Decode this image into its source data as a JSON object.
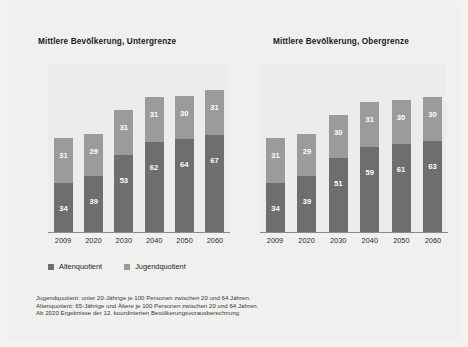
{
  "chart_data": [
    {
      "type": "bar",
      "title": "Mittlere Bevölkerung, Untergrenze",
      "xlabel": "",
      "ylabel": "",
      "stacked": true,
      "grid": false,
      "legend_position": "bottom-left",
      "categories": [
        "2009",
        "2020",
        "2030",
        "2040",
        "2050",
        "2060"
      ],
      "series": [
        {
          "name": "Altenquotient",
          "values": [
            34,
            39,
            53,
            62,
            64,
            67
          ],
          "color": "#6e6e6e"
        },
        {
          "name": "Jugendquotient",
          "values": [
            31,
            29,
            31,
            31,
            30,
            31
          ],
          "color": "#9b9b9b"
        }
      ],
      "ylim": [
        0,
        100
      ]
    },
    {
      "type": "bar",
      "title": "Mittlere Bevölkerung, Obergrenze",
      "xlabel": "",
      "ylabel": "",
      "stacked": true,
      "grid": false,
      "legend_position": "bottom-left",
      "categories": [
        "2009",
        "2020",
        "2030",
        "2040",
        "2050",
        "2060"
      ],
      "series": [
        {
          "name": "Altenquotient",
          "values": [
            34,
            39,
            51,
            59,
            61,
            63
          ],
          "color": "#6e6e6e"
        },
        {
          "name": "Jugendquotient",
          "values": [
            31,
            29,
            30,
            31,
            30,
            30
          ],
          "color": "#9b9b9b"
        }
      ],
      "ylim": [
        0,
        100
      ]
    }
  ],
  "titles": {
    "left": "Mittlere Bevölkerung, Untergrenze",
    "right": "Mittlere Bevölkerung, Obergrenze"
  },
  "legend": {
    "items": [
      {
        "label": "Altenquotient",
        "color": "#6e6e6e"
      },
      {
        "label": "Jugendquotient",
        "color": "#9b9b9b"
      }
    ]
  },
  "left": {
    "categories": [
      "2009",
      "2020",
      "2030",
      "2040",
      "2050",
      "2060"
    ],
    "old": [
      "34",
      "39",
      "53",
      "62",
      "64",
      "67"
    ],
    "young": [
      "31",
      "29",
      "31",
      "31",
      "30",
      "31"
    ]
  },
  "right": {
    "categories": [
      "2009",
      "2020",
      "2030",
      "2040",
      "2050",
      "2060"
    ],
    "old": [
      "34",
      "39",
      "51",
      "59",
      "61",
      "63"
    ],
    "young": [
      "31",
      "29",
      "30",
      "31",
      "30",
      "30"
    ]
  },
  "footnotes": [
    "Jugendquotient: unter 20-Jährige je 100 Personen zwischen 20 und 64 Jahren.",
    "Altenquotient: 65-Jährige und Ältere je 100 Personen zwischen 20 und 64 Jahren.",
    "Ab 2020 Ergebnisse der 12. koordinierten Bevölkerungsvorausberechnung."
  ],
  "colors": {
    "old_bar": "#6e6e6e",
    "young_bar": "#9b9b9b",
    "background": "#f0f0ee",
    "plot_background": "#ececea",
    "axis": "#8a8a8a"
  }
}
